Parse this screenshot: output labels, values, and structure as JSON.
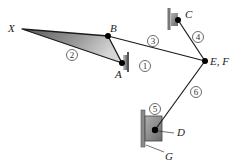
{
  "diagram": {
    "type": "planar linkage mechanism",
    "points": {
      "X": {
        "label": "X",
        "x": 22,
        "y": 29
      },
      "A": {
        "label": "A",
        "x": 122,
        "y": 63
      },
      "B": {
        "label": "B",
        "x": 108,
        "y": 36
      },
      "C": {
        "label": "C",
        "x": 178,
        "y": 20
      },
      "EF": {
        "label": "E, F",
        "x": 205,
        "y": 61
      },
      "D": {
        "label": "D",
        "x": 155,
        "y": 130
      },
      "G": {
        "label": "G"
      }
    },
    "links": [
      {
        "id": "1",
        "label": "1",
        "desc": "ground at A"
      },
      {
        "id": "2",
        "label": "2",
        "desc": "triangular link X-B-A"
      },
      {
        "id": "3",
        "label": "3",
        "desc": "link B to E,F"
      },
      {
        "id": "4",
        "label": "4",
        "desc": "link C to E,F"
      },
      {
        "id": "5",
        "label": "5",
        "desc": "slider at D"
      },
      {
        "id": "6",
        "label": "6",
        "desc": "link E,F to D"
      }
    ],
    "colors": {
      "line": "#1a1a1a",
      "shade_dark": "#6e6e6e",
      "shade_light": "#d4d4d4",
      "ground": "#8a8a8a",
      "joint": "#000000"
    }
  }
}
